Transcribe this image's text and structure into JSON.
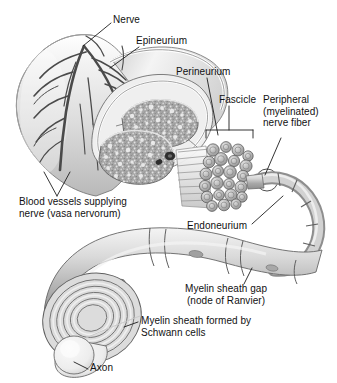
{
  "figure": {
    "background_color": "#ffffff",
    "text_color": "#111111",
    "ink_color": "#2b2b2b",
    "tissue_gray": "#9a9a9a",
    "light_gray": "#e8e8e8",
    "mid_gray": "#c4c4c4",
    "dark_gray": "#6d6d6d"
  },
  "labels": {
    "nerve": "Nerve",
    "epineurium": "Epineurium",
    "perineurium": "Perineurium",
    "fascicle": "Fascicle",
    "peripheral_fiber_line1": "Peripheral",
    "peripheral_fiber_line2": "(myelinated)",
    "peripheral_fiber_line3": "nerve fiber",
    "blood_vessels_line1": "Blood vessels supplying",
    "blood_vessels_line2": "nerve (vasa nervorum)",
    "endoneurium": "Endoneurium",
    "myelin_gap_line1": "Myelin sheath gap",
    "myelin_gap_line2": "(node of Ranvier)",
    "myelin_sheath_line1": "Myelin sheath formed by",
    "myelin_sheath_line2": "Schwann cells",
    "axon": "Axon"
  },
  "structures": {
    "nerve_trunk": "nerve-trunk",
    "cross_section": "nerve-cross-section",
    "fascicle_bundle": "fascicle-bundle",
    "myelinated_fiber": "myelinated-nerve-fiber",
    "schwann_cell_segment": "schwann-cell-segment",
    "axon_core": "axon-core",
    "myelin_rings": "myelin-spiral-rings",
    "vasa_nervorum": "vasa-nervorum-vessels"
  }
}
